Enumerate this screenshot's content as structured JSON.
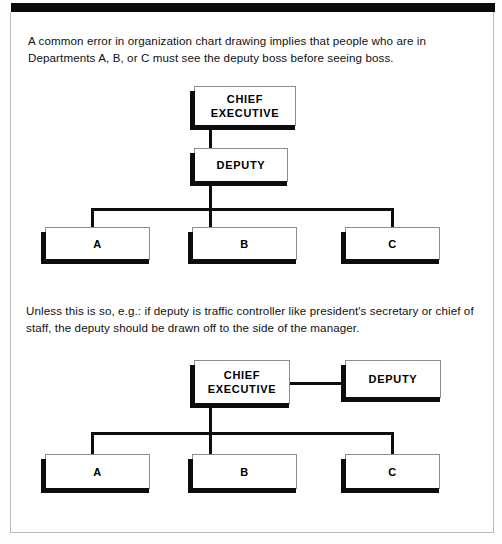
{
  "figure": {
    "background_color": "#ffffff",
    "line_color": "#0d0d0d",
    "box_fill": "#ffffff",
    "box_border": "#8d8d8d"
  },
  "captions": {
    "top": "A common error in organization chart drawing implies that people who are in Departments A, B, or C must see the deputy boss before seeing boss.",
    "middle": "Unless this is so, e.g.: if deputy is traffic controller like president's secretary or chief of staff, the deputy should be drawn off to the side of the manager."
  },
  "chart_one": {
    "name": "incorrect-deputy-in-line-chart",
    "nodes": {
      "chief_executive": "CHIEF\nEXECUTIVE",
      "deputy": "DEPUTY",
      "dept_a": "A",
      "dept_b": "B",
      "dept_c": "C"
    }
  },
  "chart_two": {
    "name": "correct-deputy-to-side-chart",
    "nodes": {
      "chief_executive": "CHIEF\nEXECUTIVE",
      "deputy": "DEPUTY",
      "dept_a": "A",
      "dept_b": "B",
      "dept_c": "C"
    }
  }
}
